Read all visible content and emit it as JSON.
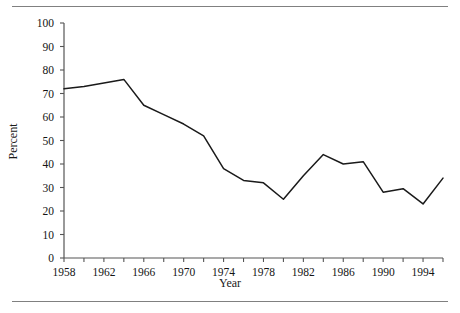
{
  "chart_data": {
    "type": "line",
    "title": "",
    "xlabel": "Year",
    "ylabel": "Percent",
    "xlim": [
      1958,
      1996
    ],
    "ylim": [
      0,
      100
    ],
    "grid": false,
    "legend": false,
    "yticks": [
      0,
      10,
      20,
      30,
      40,
      50,
      60,
      70,
      80,
      90,
      100
    ],
    "ytick_labels": [
      "0",
      "10",
      "20",
      "30",
      "40",
      "50",
      "60",
      "70",
      "80",
      "90",
      "100"
    ],
    "xticks": [
      1958,
      1960,
      1962,
      1964,
      1966,
      1968,
      1970,
      1972,
      1974,
      1976,
      1978,
      1980,
      1982,
      1984,
      1986,
      1988,
      1990,
      1992,
      1994,
      1996
    ],
    "xtick_labels": [
      "1958",
      "",
      "1962",
      "",
      "1966",
      "",
      "1970",
      "",
      "1974",
      "",
      "1978",
      "",
      "1982",
      "",
      "1986",
      "",
      "1990",
      "",
      "1994",
      ""
    ],
    "xtick_labels_shown": [
      "1958",
      "1962",
      "1966",
      "1970",
      "1974",
      "1978",
      "1982",
      "1986",
      "1990",
      "1994"
    ],
    "line_color": "#1a1a1a",
    "axis_color": "#555555",
    "x": [
      1958,
      1960,
      1962,
      1964,
      1966,
      1968,
      1970,
      1972,
      1974,
      1976,
      1978,
      1980,
      1982,
      1984,
      1986,
      1988,
      1990,
      1992,
      1994,
      1996
    ],
    "values": [
      72,
      73,
      74.5,
      76,
      65,
      61,
      57,
      52,
      38,
      33,
      32,
      25,
      35,
      44,
      40,
      41,
      28,
      29.5,
      23,
      34
    ],
    "series": [
      {
        "name": "Percent",
        "values": [
          72,
          73,
          74.5,
          76,
          65,
          61,
          57,
          52,
          38,
          33,
          32,
          25,
          35,
          44,
          40,
          41,
          28,
          29.5,
          23,
          34
        ]
      }
    ]
  },
  "figure": {
    "top_rule": "",
    "bottom_rule": ""
  }
}
